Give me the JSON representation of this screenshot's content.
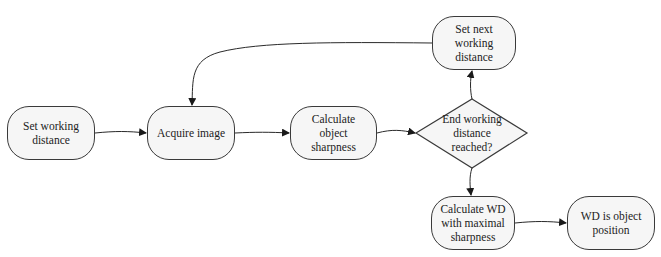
{
  "diagram": {
    "type": "flowchart",
    "nodes": {
      "set_wd": {
        "label": "Set working\ndistance",
        "shape": "rounded-rect"
      },
      "acquire": {
        "label": "Acquire image",
        "shape": "rounded-rect"
      },
      "sharpness": {
        "label": "Calculate object\nsharpness",
        "shape": "rounded-rect"
      },
      "decision": {
        "label": "End working\ndistance\nreached?",
        "shape": "diamond"
      },
      "next_wd": {
        "label": "Set next working\ndistance",
        "shape": "rounded-rect"
      },
      "calc_wd": {
        "label": "Calculate WD\nwith maximal\nsharpness",
        "shape": "rounded-rect"
      },
      "result": {
        "label": "WD is object\nposition",
        "shape": "rounded-rect"
      }
    },
    "edges": [
      {
        "from": "set_wd",
        "to": "acquire"
      },
      {
        "from": "acquire",
        "to": "sharpness"
      },
      {
        "from": "sharpness",
        "to": "decision"
      },
      {
        "from": "decision",
        "to": "next_wd"
      },
      {
        "from": "next_wd",
        "to": "acquire"
      },
      {
        "from": "decision",
        "to": "calc_wd"
      },
      {
        "from": "calc_wd",
        "to": "result"
      }
    ],
    "colors": {
      "node_fill": "#f6f6f6",
      "stroke": "#3a3a3a",
      "text": "#222222"
    }
  }
}
